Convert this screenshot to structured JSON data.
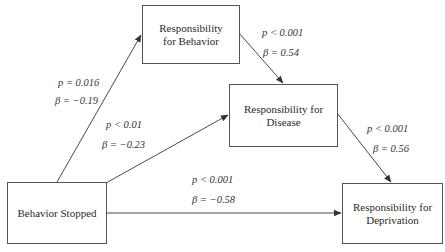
{
  "nodes": {
    "behavior_stopped": "Behavior Stopped",
    "resp_behavior": "Responsibility for Behavior",
    "resp_disease": "Responsibility for Disease",
    "resp_deprivation": "Responsibility for Deprivation"
  },
  "edges": {
    "stopped_to_behavior": {
      "p": "p = 0.016",
      "beta": "β = −0.19"
    },
    "stopped_to_disease": {
      "p": "p < 0.01",
      "beta": "β = −0.23"
    },
    "stopped_to_deprivation": {
      "p": "p < 0.001",
      "beta": "β = −0.58"
    },
    "behavior_to_disease": {
      "p": "p < 0.001",
      "beta": "β = 0.54"
    },
    "disease_to_deprivation": {
      "p": "p < 0.001",
      "beta": "β = 0.56"
    }
  },
  "colors": {
    "line": "#333333",
    "border": "#555555"
  }
}
